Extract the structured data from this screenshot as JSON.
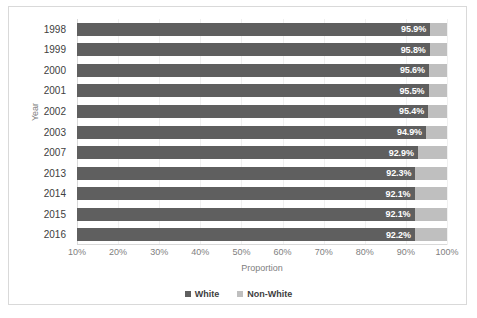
{
  "chart_data": {
    "type": "bar",
    "orientation": "horizontal",
    "stacked": true,
    "title": "",
    "xlabel": "Proportion",
    "ylabel": "Year",
    "categories": [
      "1998",
      "1999",
      "2000",
      "2001",
      "2002",
      "2003",
      "2007",
      "2013",
      "2014",
      "2015",
      "2016"
    ],
    "xlim": [
      10,
      100
    ],
    "xticks": [
      "10%",
      "20%",
      "30%",
      "40%",
      "50%",
      "60%",
      "70%",
      "80%",
      "90%",
      "100%"
    ],
    "xtick_values": [
      10,
      20,
      30,
      40,
      50,
      60,
      70,
      80,
      90,
      100
    ],
    "grid": true,
    "legend_position": "bottom",
    "series": [
      {
        "name": "White",
        "color": "#5f5f5f",
        "values": [
          95.9,
          95.8,
          95.6,
          95.5,
          95.4,
          94.9,
          92.9,
          92.3,
          92.1,
          92.1,
          92.2
        ],
        "labels": [
          "95.9%",
          "95.8%",
          "95.6%",
          "95.5%",
          "95.4%",
          "94.9%",
          "92.9%",
          "92.3%",
          "92.1%",
          "92.1%",
          "92.2%"
        ]
      },
      {
        "name": "Non-White",
        "color": "#bfbfbf",
        "values": [
          4.1,
          4.2,
          4.4,
          4.5,
          4.6,
          5.1,
          7.1,
          7.7,
          7.9,
          7.9,
          7.8
        ],
        "labels": [
          "",
          "",
          "",
          "",
          "",
          "",
          "",
          "",
          "",
          "",
          ""
        ]
      }
    ]
  },
  "legend": {
    "items": [
      {
        "label": "White",
        "color": "#5f5f5f"
      },
      {
        "label": "Non-White",
        "color": "#bfbfbf"
      }
    ]
  },
  "colors": {
    "white_series": "#5f5f5f",
    "nonwhite_series": "#bfbfbf",
    "border": "#d9d9d9",
    "gridline": "#f0f0f0",
    "axis_text": "#808080",
    "tick_text": "#404040",
    "data_label_text": "#ffffff"
  }
}
